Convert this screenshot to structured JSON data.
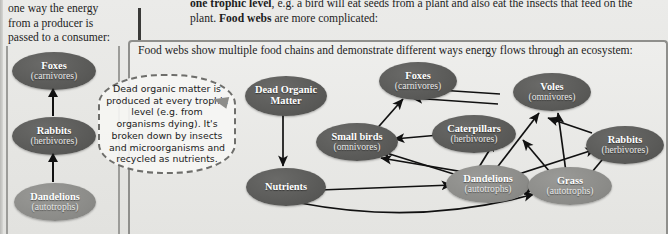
{
  "left_panel": {
    "intro_text": "one way the energy from a producer is passed to a consumer:",
    "chain": [
      {
        "name": "Foxes",
        "role": "(carnivores)"
      },
      {
        "name": "Rabbits",
        "role": "(herbivores)"
      },
      {
        "name": "Dandelions",
        "role": "(autotrophs)"
      }
    ]
  },
  "top_paragraph": {
    "line1_bold": "one trophic level",
    "line1_rest": ", e.g. a bird will eat seeds from a plant and also eat the insects that",
    "line2_pre": "feed on the plant. ",
    "line2_bold": "Food webs",
    "line2_rest": " are more complicated:"
  },
  "web_panel": {
    "heading": "Food webs show multiple food chains and demonstrate different ways energy flows through an ecosystem:",
    "nodes": [
      {
        "id": "dead-organic-matter",
        "name": "Dead Organic",
        "role": "Matter"
      },
      {
        "id": "foxes",
        "name": "Foxes",
        "role": "(carnivores)"
      },
      {
        "id": "voles",
        "name": "Voles",
        "role": "(omnivores)"
      },
      {
        "id": "small-birds",
        "name": "Small birds",
        "role": "(omnivores)"
      },
      {
        "id": "caterpillars",
        "name": "Caterpillars",
        "role": "(herbivores)"
      },
      {
        "id": "rabbits",
        "name": "Rabbits",
        "role": "(herbivores)"
      },
      {
        "id": "nutrients",
        "name": "Nutrients",
        "role": ""
      },
      {
        "id": "dandelions",
        "name": "Dandelions",
        "role": "(autotrophs)"
      },
      {
        "id": "grass",
        "name": "Grass",
        "role": "(autotrophs)"
      }
    ]
  },
  "callout": {
    "text": "Dead organic matter is produced at every trophic level (e.g. from organisms dying). It's broken down by insects and microorganisms and recycled as nutrients."
  },
  "colors": {
    "node_dark": "#585856",
    "node_light": "#8a8a87",
    "page_bg": "#e8e8e6",
    "border": "#8f8f8c",
    "arrow": "#111111"
  }
}
